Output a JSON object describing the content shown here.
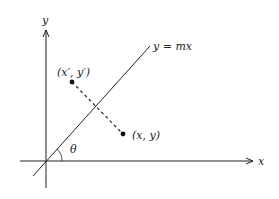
{
  "diagram": {
    "axes": {
      "x_label": "x",
      "y_label": "y"
    },
    "line_label": "y = mx",
    "angle_label": "θ",
    "points": {
      "reflected": "(x′, y′)",
      "original": "(x, y)"
    },
    "colors": {
      "ink": "#222222",
      "background": "#ffffff"
    }
  }
}
